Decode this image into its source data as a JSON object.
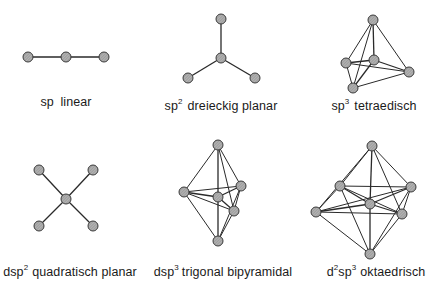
{
  "colors": {
    "edge": "#2a2a2a",
    "node_fill": "#a8a8a8",
    "node_stroke": "#3a3a3a",
    "text": "#1a1a1a"
  },
  "geometries": [
    {
      "id": "sp",
      "label": {
        "pre": "sp",
        "sup1": "",
        "mid": "",
        "sup2": "",
        "post": " linear"
      },
      "nodes": [
        "left",
        "center",
        "right"
      ],
      "edges": [
        [
          "left",
          "center"
        ],
        [
          "center",
          "right"
        ]
      ]
    },
    {
      "id": "sp2",
      "label": {
        "pre": "sp",
        "sup1": "2",
        "mid": "",
        "sup2": "",
        "post": "dreieckig planar"
      },
      "nodes": [
        "top",
        "center",
        "bottom-left",
        "bottom-right"
      ],
      "edges": [
        [
          "center",
          "top"
        ],
        [
          "center",
          "bottom-left"
        ],
        [
          "center",
          "bottom-right"
        ]
      ]
    },
    {
      "id": "sp3",
      "label": {
        "pre": "sp",
        "sup1": "3",
        "mid": "",
        "sup2": "",
        "post": "tetraedisch"
      },
      "nodes": [
        "top",
        "left",
        "center",
        "right",
        "bottom"
      ],
      "edges": [
        [
          "top",
          "left"
        ],
        [
          "top",
          "center"
        ],
        [
          "top",
          "right"
        ],
        [
          "top",
          "bottom"
        ],
        [
          "center",
          "left"
        ],
        [
          "center",
          "right"
        ],
        [
          "center",
          "bottom"
        ],
        [
          "left",
          "right"
        ],
        [
          "left",
          "bottom"
        ],
        [
          "bottom",
          "right"
        ]
      ]
    },
    {
      "id": "dsp2",
      "label": {
        "pre": "dsp",
        "sup1": "2",
        "mid": "",
        "sup2": "",
        "post": "quadratisch planar"
      },
      "nodes": [
        "center",
        "top-left",
        "top-right",
        "bottom-left",
        "bottom-right"
      ],
      "edges": [
        [
          "center",
          "top-left"
        ],
        [
          "center",
          "top-right"
        ],
        [
          "center",
          "bottom-left"
        ],
        [
          "center",
          "bottom-right"
        ]
      ]
    },
    {
      "id": "dsp3",
      "label": {
        "pre": "dsp",
        "sup1": "3",
        "mid": "",
        "sup2": "",
        "post": "trigonal bipyramidal"
      },
      "nodes": [
        "top",
        "left",
        "center",
        "right",
        "lower-right",
        "bottom"
      ],
      "edges": [
        [
          "top",
          "left"
        ],
        [
          "top",
          "center"
        ],
        [
          "top",
          "right"
        ],
        [
          "top",
          "lower-right"
        ],
        [
          "bottom",
          "left"
        ],
        [
          "bottom",
          "center"
        ],
        [
          "bottom",
          "right"
        ],
        [
          "bottom",
          "lower-right"
        ],
        [
          "left",
          "right"
        ],
        [
          "left",
          "lower-right"
        ],
        [
          "left",
          "center"
        ],
        [
          "center",
          "right"
        ],
        [
          "center",
          "lower-right"
        ],
        [
          "right",
          "lower-right"
        ]
      ]
    },
    {
      "id": "d2sp3",
      "label": {
        "pre": "d",
        "sup1": "2",
        "mid": "sp",
        "sup2": "3",
        "post": "oktaedrisch"
      },
      "nodes": [
        "top",
        "upper-left",
        "left",
        "center",
        "right",
        "lower-right",
        "bottom"
      ],
      "edges": [
        [
          "top",
          "upper-left"
        ],
        [
          "top",
          "left"
        ],
        [
          "top",
          "center"
        ],
        [
          "top",
          "right"
        ],
        [
          "top",
          "lower-right"
        ],
        [
          "bottom",
          "upper-left"
        ],
        [
          "bottom",
          "left"
        ],
        [
          "bottom",
          "center"
        ],
        [
          "bottom",
          "right"
        ],
        [
          "bottom",
          "lower-right"
        ],
        [
          "upper-left",
          "left"
        ],
        [
          "upper-left",
          "right"
        ],
        [
          "upper-left",
          "lower-right"
        ],
        [
          "left",
          "right"
        ],
        [
          "left",
          "lower-right"
        ],
        [
          "left",
          "center"
        ],
        [
          "center",
          "right"
        ],
        [
          "right",
          "lower-right"
        ],
        [
          "upper-left",
          "center"
        ],
        [
          "center",
          "lower-right"
        ]
      ]
    }
  ]
}
